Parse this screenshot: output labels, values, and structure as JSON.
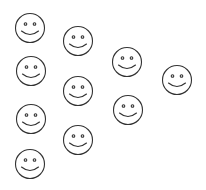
{
  "canvas": {
    "width": 206,
    "height": 190,
    "background": "#ffffff"
  },
  "style": {
    "stroke_color": "#333333",
    "face_radius": 14.5,
    "stroke_width": 1.1
  },
  "faces": [
    {
      "id": 1,
      "cx": 30,
      "cy": 28,
      "expression": "smile"
    },
    {
      "id": 2,
      "cx": 78,
      "cy": 41,
      "expression": "smile"
    },
    {
      "id": 3,
      "cx": 127,
      "cy": 62,
      "expression": "smile"
    },
    {
      "id": 4,
      "cx": 177,
      "cy": 80,
      "expression": "smile"
    },
    {
      "id": 5,
      "cx": 31,
      "cy": 71,
      "expression": "smile"
    },
    {
      "id": 6,
      "cx": 78,
      "cy": 91,
      "expression": "smile"
    },
    {
      "id": 7,
      "cx": 128,
      "cy": 110,
      "expression": "smile"
    },
    {
      "id": 8,
      "cx": 31,
      "cy": 119,
      "expression": "smile"
    },
    {
      "id": 9,
      "cx": 78,
      "cy": 140,
      "expression": "smile"
    },
    {
      "id": 10,
      "cx": 30,
      "cy": 164,
      "expression": "smile"
    }
  ],
  "summary": {
    "face_count": 10,
    "icon": "smiley-face-icon"
  }
}
